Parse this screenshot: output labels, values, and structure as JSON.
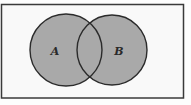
{
  "diagram": {
    "type": "venn",
    "universe": {
      "x": 1.5,
      "y": 4.5,
      "width": 182,
      "height": 93.5
    },
    "sets": [
      {
        "label": "A",
        "cx": 66,
        "cy": 50,
        "r": 36
      },
      {
        "label": "B",
        "cx": 112,
        "cy": 50,
        "r": 35
      }
    ],
    "colors": {
      "fill": "#a9a9a9",
      "stroke": "#2b2b2b",
      "background": "#f9f9f9"
    }
  }
}
